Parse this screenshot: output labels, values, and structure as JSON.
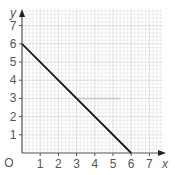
{
  "chart_data": {
    "type": "line",
    "title": "",
    "xlabel": "x",
    "ylabel": "y",
    "origin_label": "O",
    "xlim": [
      0,
      7.8
    ],
    "ylim": [
      0,
      7.8
    ],
    "x_ticks": [
      1,
      2,
      3,
      4,
      5,
      6,
      7
    ],
    "y_ticks": [
      1,
      2,
      3,
      4,
      5,
      6,
      7
    ],
    "grid": true,
    "minor_grid_step": 0.2,
    "series": [
      {
        "name": "line",
        "x": [
          0,
          6
        ],
        "y": [
          6,
          0
        ],
        "color": "#1a1a1a"
      }
    ],
    "annotations": [
      {
        "type": "faint-horizontal-mark",
        "y": 3,
        "x_from": 3,
        "x_to": 5.4,
        "color": "#c8c8c8"
      }
    ]
  },
  "colors": {
    "grid_minor": "#e4e4e4",
    "grid_major": "#c9c9c9",
    "axis": "#555555",
    "line": "#1a1a1a",
    "text": "#555555"
  }
}
